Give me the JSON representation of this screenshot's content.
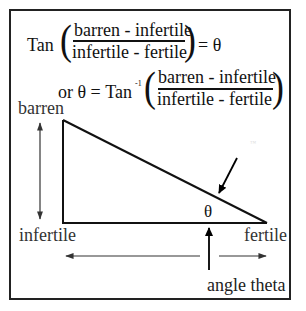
{
  "equation1": {
    "func": "Tan",
    "numerator": "barren - infertile",
    "denominator": "infertile - fertile",
    "result": "= θ"
  },
  "equation2": {
    "prefix": "or  θ = Tan",
    "superscript": "-1",
    "numerator": "barren - infertile",
    "denominator": "infertile - fertile"
  },
  "diagram": {
    "labels": {
      "top_left": "barren",
      "bottom_left": "infertile",
      "bottom_right": "fertile",
      "angle_symbol": "θ",
      "angle_caption": "angle theta"
    },
    "watermark": "™",
    "colors": {
      "stroke": "#111111",
      "arrow_gray": "#333333",
      "background": "#ffffff"
    }
  }
}
